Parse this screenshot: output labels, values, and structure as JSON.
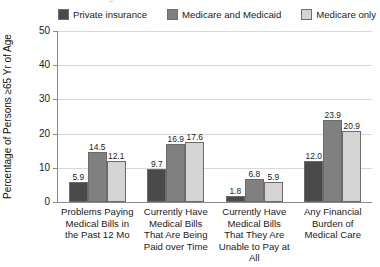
{
  "top_cut_text": "Figure continued from above",
  "legend": {
    "items": [
      {
        "label": "Private insurance",
        "color": "#4a4a4a",
        "icon": "legend-swatch-icon"
      },
      {
        "label": "Medicare and Medicaid",
        "color": "#808080",
        "icon": "legend-swatch-icon"
      },
      {
        "label": "Medicare only",
        "color": "#d4d4d4",
        "icon": "legend-swatch-icon"
      }
    ]
  },
  "axis": {
    "y_title": "Percentage of Persons ≥65 Yr of Age",
    "y_ticks": [
      "0",
      "10",
      "20",
      "30",
      "40",
      "50"
    ]
  },
  "chart_data": {
    "type": "bar",
    "title": "",
    "subtitle": "",
    "xlabel": "",
    "ylabel": "Percentage of Persons ≥65 Yr of Age",
    "ylim": [
      0,
      50
    ],
    "yticks": [
      0,
      10,
      20,
      30,
      40,
      50
    ],
    "grid": true,
    "legend_position": "top",
    "categories": [
      "Problems Paying Medical Bills in the Past 12 Mo",
      "Currently Have Medical Bills That Are Being Paid over Time",
      "Currently Have Medical Bills That They Are Unable to Pay at All",
      "Any Financial Burden of Medical Care"
    ],
    "category_lines": [
      [
        "Problems Paying",
        "Medical Bills in",
        "the Past 12 Mo"
      ],
      [
        "Currently Have",
        "Medical Bills",
        "That Are Being",
        "Paid over Time"
      ],
      [
        "Currently Have",
        "Medical Bills",
        "That They Are",
        "Unable to Pay at All"
      ],
      [
        "Any Financial",
        "Burden of",
        "Medical Care"
      ]
    ],
    "series": [
      {
        "name": "Private insurance",
        "color": "#4a4a4a",
        "values": [
          5.9,
          9.7,
          1.8,
          12.0
        ],
        "labels": [
          "5.9",
          "9.7",
          "1.8",
          "12.0"
        ]
      },
      {
        "name": "Medicare and Medicaid",
        "color": "#808080",
        "values": [
          14.5,
          16.9,
          6.8,
          23.9
        ],
        "labels": [
          "14.5",
          "16.9",
          "6.8",
          "23.9"
        ]
      },
      {
        "name": "Medicare only",
        "color": "#d4d4d4",
        "values": [
          12.1,
          17.6,
          5.9,
          20.9
        ],
        "labels": [
          "12.1",
          "17.6",
          "5.9",
          "20.9"
        ]
      }
    ]
  }
}
